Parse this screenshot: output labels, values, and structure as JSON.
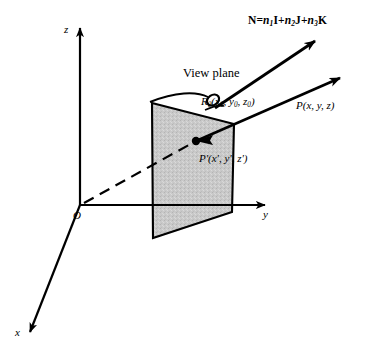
{
  "figure": {
    "title_text": "3D view plane geometry diagram",
    "axes": {
      "z_label": "z",
      "y_label": "y",
      "x_label": "x",
      "origin_label": "O"
    },
    "labels": {
      "normal_vector": {
        "name": "N",
        "equals": "=",
        "term1_coef": "n",
        "term1_sub": "1",
        "term1_basis": "I",
        "plus1": "+",
        "term2_coef": "n",
        "term2_sub": "2",
        "term2_basis": "J",
        "plus2": "+",
        "term3_coef": "n",
        "term3_sub": "3",
        "term3_basis": "K",
        "full_text": "N = n1I + n2J + n3K"
      },
      "view_plane": "View plane",
      "reference_point": {
        "name": "R",
        "sub": "0",
        "coords": "(x0, y0, z0)",
        "full_text": "R0(x0, y0, z0)"
      },
      "point_p": "P(x, y, z)",
      "point_p_prime": "P'(x', y', z')"
    },
    "colors": {
      "stroke": "#000000",
      "plane_fill": "#c8c8c8",
      "background": "#ffffff"
    }
  }
}
